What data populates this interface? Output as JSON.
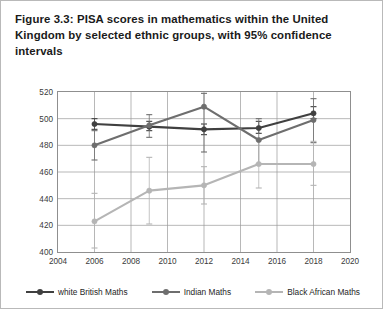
{
  "figure": {
    "title": "Figure 3.3: PISA scores in mathematics within the United Kingdom by selected ethnic groups, with 95% confidence intervals"
  },
  "chart_data": {
    "type": "line",
    "title": "Figure 3.3: PISA scores in mathematics within the United Kingdom by selected ethnic groups, with 95% confidence intervals",
    "xlabel": "",
    "ylabel": "",
    "xlim": [
      2004,
      2020
    ],
    "ylim": [
      400,
      520
    ],
    "xticks": [
      2004,
      2006,
      2008,
      2010,
      2012,
      2014,
      2016,
      2018,
      2020
    ],
    "yticks": [
      400,
      420,
      440,
      460,
      480,
      500,
      520
    ],
    "grid": true,
    "legend_position": "bottom",
    "x": [
      2006,
      2009,
      2012,
      2015,
      2018
    ],
    "series": [
      {
        "name": "white British Maths",
        "color": "#404040",
        "values": [
          496,
          494,
          492,
          493,
          504
        ],
        "err_low": [
          492,
          491,
          488,
          489,
          500
        ],
        "err_high": [
          500,
          498,
          496,
          498,
          509
        ]
      },
      {
        "name": "Indian Maths",
        "color": "#6e6e6e",
        "values": [
          480,
          495,
          509,
          484,
          499
        ],
        "err_low": [
          469,
          486,
          475,
          466,
          482
        ],
        "err_high": [
          491,
          503,
          519,
          500,
          515
        ]
      },
      {
        "name": "Black African Maths",
        "color": "#b5b5b5",
        "values": [
          423,
          446,
          450,
          466,
          466
        ],
        "err_low": [
          403,
          421,
          436,
          448,
          450
        ],
        "err_high": [
          444,
          471,
          464,
          484,
          483
        ]
      }
    ]
  },
  "legend": {
    "items": [
      {
        "label": "white British Maths"
      },
      {
        "label": "Indian Maths"
      },
      {
        "label": "Black African Maths"
      }
    ]
  }
}
